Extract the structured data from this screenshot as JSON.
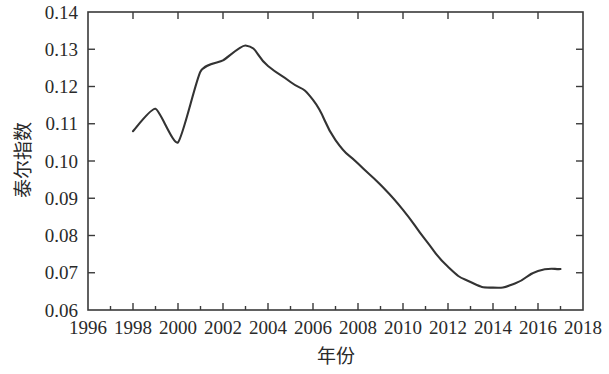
{
  "chart_data": {
    "type": "line",
    "title": "",
    "xlabel": "年份",
    "ylabel": "泰尔指数",
    "xlim": [
      1996,
      2018
    ],
    "ylim": [
      0.06,
      0.14
    ],
    "grid": false,
    "legend": "none",
    "line_color": "#333333",
    "x_ticks": [
      1996,
      1998,
      2000,
      2002,
      2004,
      2006,
      2008,
      2010,
      2012,
      2014,
      2016,
      2018
    ],
    "x_tick_labels": [
      "1996",
      "1998",
      "2000",
      "2002",
      "2004",
      "2006",
      "2008",
      "2010",
      "2012",
      "2014",
      "2016",
      "2018"
    ],
    "y_ticks": [
      0.06,
      0.07,
      0.08,
      0.09,
      0.1,
      0.11,
      0.12,
      0.13,
      0.14
    ],
    "y_tick_labels": [
      "0.06",
      "0.07",
      "0.08",
      "0.09",
      "0.10",
      "0.11",
      "0.12",
      "0.13",
      "0.14"
    ],
    "x_minor_ticks": [
      1997,
      1999,
      2001,
      2003,
      2005,
      2007,
      2009,
      2011,
      2013,
      2015,
      2017
    ],
    "series": [
      {
        "name": "泰尔指数",
        "x": [
          1998,
          1999,
          2000,
          2001,
          2002,
          2003,
          2004,
          2005,
          2006,
          2007,
          2008,
          2009,
          2010,
          2011,
          2012,
          2013,
          2014,
          2015,
          2016,
          2017
        ],
        "values": [
          0.108,
          0.114,
          0.105,
          0.124,
          0.127,
          0.131,
          0.1255,
          0.1212,
          0.1164,
          0.1056,
          0.0993,
          0.0936,
          0.0869,
          0.0788,
          0.0716,
          0.0675,
          0.066,
          0.0672,
          0.0705,
          0.071
        ]
      }
    ]
  }
}
